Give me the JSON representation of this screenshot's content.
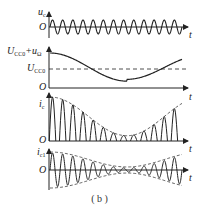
{
  "figure": {
    "caption": "( b )",
    "panels": [
      {
        "id": "uc",
        "ylabel": "u",
        "ylabel_sub": "c",
        "origin": "O",
        "xlabel": "t",
        "description": "carrier sine wave, constant amplitude"
      },
      {
        "id": "bias",
        "ylabel": "U",
        "ylabel_sub": "CC0",
        "ylabel_extra": "+u",
        "ylabel_extra_sub": "Ω",
        "ref_label": "U",
        "ref_label_sub": "CC0",
        "origin": "O",
        "xlabel": "t",
        "description": "collector supply voltage varying with modulating signal, dashed reference at U_CC0"
      },
      {
        "id": "ic",
        "ylabel": "i",
        "ylabel_sub": "c",
        "origin": "O",
        "xlabel": "t",
        "description": "collector current pulses with dashed envelope"
      },
      {
        "id": "ic1",
        "ylabel": "i",
        "ylabel_sub": "c1",
        "origin": "O",
        "xlabel": "t",
        "description": "fundamental current, amplitude-modulated oscillation with dashed envelope"
      }
    ]
  },
  "colors": {
    "line": "#222222",
    "background": "#ffffff"
  }
}
